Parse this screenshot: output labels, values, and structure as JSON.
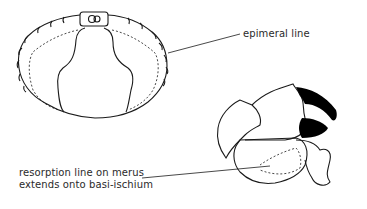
{
  "figure": {
    "panels": [
      {
        "name": "carapace-ventral-view",
        "description": "Crab ventral/dorsal carapace outline with dashed epimeral line"
      },
      {
        "name": "cheliped-lateral-view",
        "description": "Crab cheliped (claw) with black-tipped fingers and dashed resorption line on merus"
      }
    ],
    "annotations": {
      "epimeral": "epimeral line",
      "resorption_line1": "resorption line on merus",
      "resorption_line2": "extends onto basi-ischium"
    },
    "colors": {
      "ink": "#1a1a1a",
      "background": "#ffffff",
      "claw_tip": "#000000"
    }
  }
}
